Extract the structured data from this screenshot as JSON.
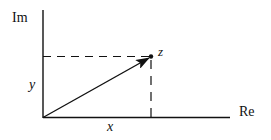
{
  "diagram": {
    "axes": {
      "vertical_label": "Im",
      "horizontal_label": "Re"
    },
    "point": {
      "label": "z"
    },
    "components": {
      "real_label": "x",
      "imag_label": "y"
    },
    "colors": {
      "stroke": "#111111",
      "background": "#ffffff"
    }
  }
}
